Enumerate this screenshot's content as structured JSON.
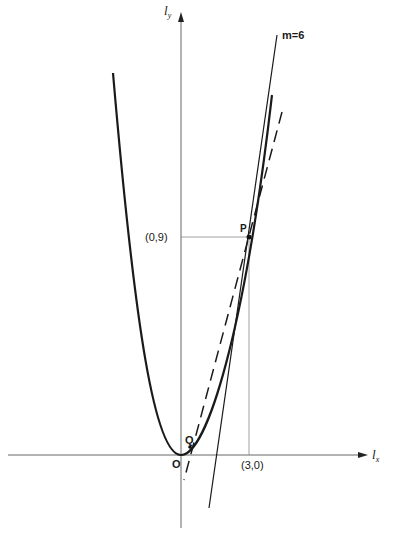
{
  "diagram": {
    "type": "tangent-line-to-parabola",
    "axes": {
      "x_label": "l",
      "x_subscript": "x",
      "y_label": "l",
      "y_subscript": "y"
    },
    "origin_label": "O",
    "points": {
      "P": {
        "label": "P",
        "coords": [
          3,
          9
        ]
      },
      "Q": {
        "label": "Q"
      }
    },
    "tick_labels": {
      "x_tick": "(3,0)",
      "y_tick": "(0,9)"
    },
    "curve": {
      "equation": "y = x^2",
      "style": "solid-thick"
    },
    "tangent_line": {
      "label": "m=6",
      "slope": 6,
      "through": [
        3,
        9
      ],
      "style": "solid"
    },
    "secant_line": {
      "through": [
        "Q",
        "P"
      ],
      "style": "dashed"
    },
    "colors": {
      "background": "#ffffff",
      "ink": "#1a1a1a",
      "axis": "#555555",
      "guide": "#777777"
    }
  }
}
